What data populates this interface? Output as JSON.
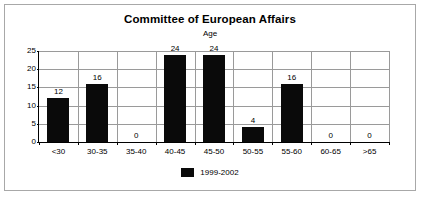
{
  "chart_data": {
    "type": "bar",
    "title": "Committee of European Affairs",
    "subtitle": "Age",
    "xlabel": "",
    "ylabel": "",
    "categories": [
      "<30",
      "30-35",
      "35-40",
      "40-45",
      "45-50",
      "50-55",
      "55-60",
      "60-65",
      ">65"
    ],
    "series": [
      {
        "name": "1999-2002",
        "values": [
          12,
          16,
          0,
          24,
          24,
          4,
          16,
          0,
          0
        ],
        "color": "#0a0a0a"
      }
    ],
    "ylim": [
      0,
      25
    ],
    "yticks": [
      0,
      5,
      10,
      15,
      20,
      25
    ],
    "ytick_labels": [
      "0",
      "5",
      "10",
      "15",
      "20",
      "25"
    ],
    "data_labels": [
      "12",
      "16",
      "0",
      "24",
      "24",
      "4",
      "16",
      "0",
      "0"
    ],
    "grid": "horizontal-and-vertical",
    "legend_position": "bottom-center",
    "bar_color": "#0a0a0a",
    "gridline_color": "#9a9a9a",
    "axis_color": "#000000",
    "border_color": "#a8a8a8",
    "background": "#ffffff"
  },
  "legend": {
    "entries": [
      {
        "label": "1999-2002",
        "color": "#0a0a0a"
      }
    ]
  }
}
